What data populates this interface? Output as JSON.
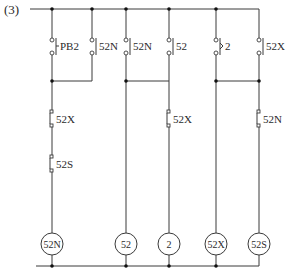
{
  "diagram": {
    "number_label": "(3)",
    "colors": {
      "line": "#3a3a3a",
      "junction": "#111111",
      "background": "#ffffff"
    },
    "top_contacts": [
      {
        "label": "PB2",
        "type": "push-button-no",
        "column": 1
      },
      {
        "label": "52N",
        "type": "no-contact",
        "column": 2
      },
      {
        "label": "52N",
        "type": "no-contact",
        "column": 3
      },
      {
        "label": "52",
        "type": "no-contact",
        "column": 4
      },
      {
        "label": "2",
        "type": "timer-no-contact",
        "column": 5
      },
      {
        "label": "52X",
        "type": "no-contact",
        "column": 6
      }
    ],
    "lower_contacts": [
      {
        "label": "52X",
        "type": "nc-contact",
        "column": 1
      },
      {
        "label": "52S",
        "type": "nc-contact",
        "column": 1
      },
      {
        "label": "52X",
        "type": "nc-contact",
        "column": 4
      },
      {
        "label": "52N",
        "type": "nc-contact",
        "column": 6
      }
    ],
    "coils": [
      {
        "label": "52N"
      },
      {
        "label": "52"
      },
      {
        "label": "2"
      },
      {
        "label": "52X"
      },
      {
        "label": "52S"
      }
    ]
  }
}
